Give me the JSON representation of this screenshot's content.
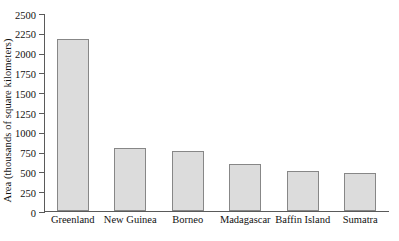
{
  "chart_data": {
    "type": "bar",
    "title": "",
    "subtitle": "",
    "xlabel": "",
    "ylabel": "Area (thousands of square kilometers)",
    "categories": [
      "Greenland",
      "New Guinea",
      "Borneo",
      "Madagascar",
      "Baffin Island",
      "Sumatra"
    ],
    "values": [
      2175,
      790,
      755,
      590,
      505,
      475
    ],
    "ylim": [
      0,
      2500
    ],
    "yticks": [
      0,
      250,
      500,
      750,
      1000,
      1250,
      1500,
      1750,
      2000,
      2250,
      2500
    ],
    "ytick_labels": [
      "0",
      "250",
      "500",
      "750",
      "1000",
      "1250",
      "1500",
      "1750",
      "2000",
      "2250",
      "2500"
    ],
    "grid": false,
    "legend": null,
    "bar_fill_color": "#dcdcdc",
    "bar_border_color": "#878787",
    "axis_color": "#5a5a5a",
    "background_color": "#ffffff"
  }
}
